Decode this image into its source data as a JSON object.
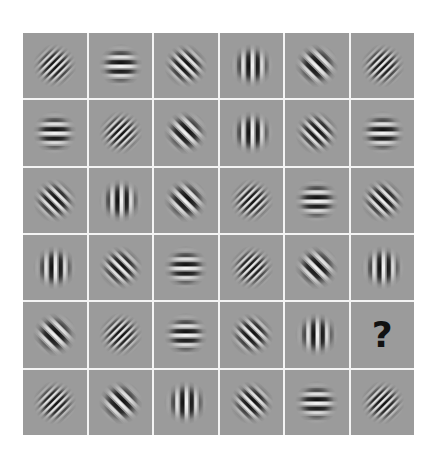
{
  "puzzle": {
    "rows": 6,
    "cols": 6,
    "background_color": "#9b9b9b",
    "separator_color": "#f4f4f4",
    "cells": [
      [
        {
          "orientation": 45,
          "freq": "high"
        },
        {
          "orientation": 0,
          "freq": "low"
        },
        {
          "orientation": -45,
          "freq": "mid"
        },
        {
          "orientation": 90,
          "freq": "low"
        },
        {
          "orientation": -45,
          "freq": "low"
        },
        {
          "orientation": 45,
          "freq": "high"
        }
      ],
      [
        {
          "orientation": 0,
          "freq": "low"
        },
        {
          "orientation": 45,
          "freq": "high"
        },
        {
          "orientation": -45,
          "freq": "low"
        },
        {
          "orientation": 90,
          "freq": "low"
        },
        {
          "orientation": -45,
          "freq": "mid"
        },
        {
          "orientation": 0,
          "freq": "low"
        }
      ],
      [
        {
          "orientation": -45,
          "freq": "mid"
        },
        {
          "orientation": 90,
          "freq": "low"
        },
        {
          "orientation": -45,
          "freq": "low"
        },
        {
          "orientation": 45,
          "freq": "high"
        },
        {
          "orientation": 0,
          "freq": "low"
        },
        {
          "orientation": -45,
          "freq": "mid"
        }
      ],
      [
        {
          "orientation": 90,
          "freq": "low"
        },
        {
          "orientation": -45,
          "freq": "mid"
        },
        {
          "orientation": 0,
          "freq": "low"
        },
        {
          "orientation": 45,
          "freq": "high"
        },
        {
          "orientation": -45,
          "freq": "low"
        },
        {
          "orientation": 90,
          "freq": "low"
        }
      ],
      [
        {
          "orientation": -45,
          "freq": "low"
        },
        {
          "orientation": 45,
          "freq": "high"
        },
        {
          "orientation": 0,
          "freq": "low"
        },
        {
          "orientation": -45,
          "freq": "mid"
        },
        {
          "orientation": 90,
          "freq": "low"
        },
        {
          "question": true,
          "label": "?"
        }
      ],
      [
        {
          "orientation": 45,
          "freq": "high"
        },
        {
          "orientation": -45,
          "freq": "low"
        },
        {
          "orientation": 90,
          "freq": "low"
        },
        {
          "orientation": -45,
          "freq": "mid"
        },
        {
          "orientation": 0,
          "freq": "low"
        },
        {
          "orientation": 45,
          "freq": "high"
        }
      ]
    ]
  }
}
